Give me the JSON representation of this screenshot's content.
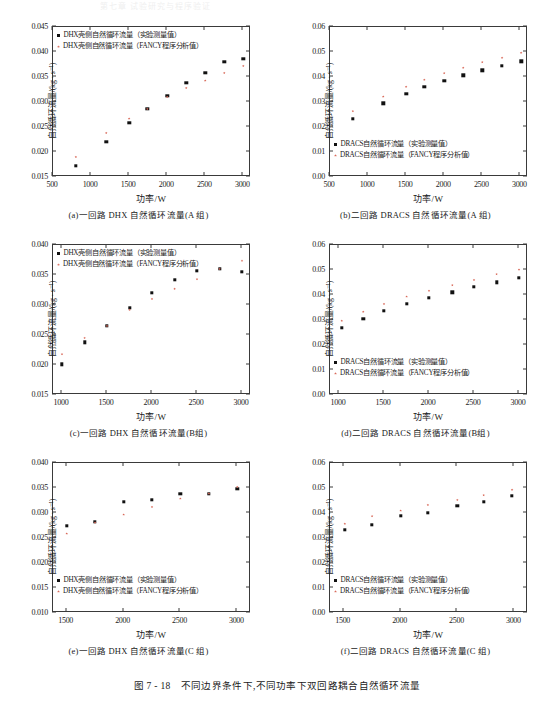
{
  "header": {
    "running_head": "第七章 试验研究与程序验证"
  },
  "figure": {
    "caption": "图 7 - 18　不同边界条件下,不同功率下双回路耦合自然循环流量",
    "xlabel": "功率/W",
    "ylabel_dhx": "自然循环流量/(kg · s⁻¹)",
    "ylabel_dracs": "自然循环流量/(kg · s⁻¹)"
  },
  "colors": {
    "experiment": "#111111",
    "fancy": "#d96a5a",
    "axis": "#3a3a3a"
  },
  "legends": {
    "dhx_exp": "DHX壳侧自然循环流量（实验测量值）",
    "dhx_fancy": "DHX壳侧自然循环流量（FANCY程序分析值）",
    "dracs_exp": "DRACS自然循环流量（实验测量值）",
    "dracs_fancy": "DRACS自然循环流量（FANCY程序分析值）"
  },
  "chart_data": [
    {
      "id": "a",
      "type": "scatter",
      "caption": "(a)一回路 DHX 自然循环流量(A 组)",
      "title": "",
      "xlabel": "功率/W",
      "ylabel": "自然循环流量/(kg · s⁻¹)",
      "xlim": [
        500,
        3100
      ],
      "ylim": [
        0.015,
        0.045
      ],
      "xticks": [
        500,
        1000,
        1500,
        2000,
        2500,
        3000
      ],
      "yticks": [
        0.015,
        0.02,
        0.025,
        0.03,
        0.035,
        0.04,
        0.045
      ],
      "ytick_labels": [
        "0.015",
        "0.020",
        "0.025",
        "0.030",
        "0.035",
        "0.040",
        "0.045"
      ],
      "legend_position": "upper-left",
      "grid": false,
      "x": [
        800,
        1200,
        1500,
        1740,
        2000,
        2250,
        2500,
        2750,
        3000
      ],
      "series": [
        {
          "name": "DHX壳侧自然循环流量（实验测量值）",
          "marker": "square",
          "color": "#111111",
          "values": [
            0.0173,
            0.0221,
            0.0258,
            0.0286,
            0.0312,
            0.0339,
            0.0358,
            0.038,
            0.0386
          ]
        },
        {
          "name": "DHX壳侧自然循环流量（FANCY程序分析值）",
          "marker": "star",
          "color": "#d96a5a",
          "values": [
            0.019,
            0.0238,
            0.0267,
            0.0286,
            0.031,
            0.0328,
            0.0343,
            0.0358,
            0.0372
          ]
        }
      ]
    },
    {
      "id": "b",
      "type": "scatter",
      "caption": "(b)二回路 DRACS 自然循环流量(A 组)",
      "title": "",
      "xlabel": "功率/W",
      "ylabel": "自然循环流量/(kg · s⁻¹)",
      "xlim": [
        500,
        3100
      ],
      "ylim": [
        0.0,
        0.06
      ],
      "xticks": [
        500,
        1000,
        1500,
        2000,
        2500,
        3000
      ],
      "yticks": [
        0.0,
        0.01,
        0.02,
        0.03,
        0.04,
        0.05,
        0.06
      ],
      "ytick_labels": [
        "0.00",
        "0.01",
        "0.02",
        "0.03",
        "0.04",
        "0.05",
        "0.06"
      ],
      "legend_position": "lower-left",
      "grid": false,
      "x": [
        800,
        1200,
        1500,
        1740,
        2000,
        2250,
        2500,
        2760,
        3010
      ],
      "series": [
        {
          "name": "DRACS自然循环流量（实验测量值）",
          "marker": "square",
          "color": "#111111",
          "values": [
            0.0232,
            0.0295,
            0.0332,
            0.0362,
            0.0384,
            0.0407,
            0.0427,
            0.0446,
            0.0463
          ]
        },
        {
          "name": "DRACS自然循环流量（FANCY程序分析值）",
          "marker": "star",
          "color": "#d96a5a",
          "values": [
            0.0263,
            0.0322,
            0.0361,
            0.0389,
            0.0415,
            0.0437,
            0.0459,
            0.0477,
            0.0497
          ]
        }
      ]
    },
    {
      "id": "c",
      "type": "scatter",
      "caption": "(c)一回路 DHX 自然循环流量(B组)",
      "title": "",
      "xlabel": "功率/W",
      "ylabel": "自然循环流量/(kg · s⁻¹)",
      "xlim": [
        900,
        3100
      ],
      "ylim": [
        0.015,
        0.04
      ],
      "xticks": [
        1000,
        1500,
        2000,
        2500,
        3000
      ],
      "yticks": [
        0.015,
        0.02,
        0.025,
        0.03,
        0.035,
        0.04
      ],
      "ytick_labels": [
        "0.015",
        "0.020",
        "0.025",
        "0.030",
        "0.035",
        "0.040"
      ],
      "legend_position": "upper-left",
      "grid": false,
      "x": [
        1000,
        1250,
        1500,
        1750,
        2000,
        2250,
        2500,
        2750,
        3000
      ],
      "series": [
        {
          "name": "DHX壳侧自然循环流量（实验测量值）",
          "marker": "square",
          "color": "#111111",
          "values": [
            0.0201,
            0.0238,
            0.0265,
            0.0295,
            0.032,
            0.0342,
            0.0357,
            0.036,
            0.0355
          ]
        },
        {
          "name": "DHX壳侧自然循环流量（FANCY程序分析值）",
          "marker": "star",
          "color": "#d96a5a",
          "values": [
            0.0218,
            0.0245,
            0.0265,
            0.0292,
            0.031,
            0.0327,
            0.0343,
            0.036,
            0.0374
          ]
        }
      ]
    },
    {
      "id": "d",
      "type": "scatter",
      "caption": "(d)二回路 DRACS 自然循环流量(B组)",
      "title": "",
      "xlabel": "功率/W",
      "ylabel": "自然循环流量/(kg · s⁻¹)",
      "xlim": [
        900,
        3100
      ],
      "ylim": [
        0.0,
        0.06
      ],
      "xticks": [
        1000,
        1500,
        2000,
        2500,
        3000
      ],
      "yticks": [
        0.0,
        0.01,
        0.02,
        0.03,
        0.04,
        0.05,
        0.06
      ],
      "ytick_labels": [
        "0.00",
        "0.01",
        "0.02",
        "0.03",
        "0.04",
        "0.05",
        "0.06"
      ],
      "legend_position": "lower-left",
      "grid": false,
      "x": [
        1030,
        1270,
        1500,
        1750,
        2000,
        2260,
        2500,
        2750,
        3000
      ],
      "series": [
        {
          "name": "DRACS自然循环流量（实验测量值）",
          "marker": "square",
          "color": "#111111",
          "values": [
            0.027,
            0.0305,
            0.0336,
            0.0366,
            0.0388,
            0.0411,
            0.0432,
            0.0451,
            0.047
          ]
        },
        {
          "name": "DRACS自然循环流量（FANCY程序分析值）",
          "marker": "star",
          "color": "#d96a5a",
          "values": [
            0.0297,
            0.0333,
            0.0364,
            0.0394,
            0.0417,
            0.0439,
            0.046,
            0.0483,
            0.0502
          ]
        }
      ]
    },
    {
      "id": "e",
      "type": "scatter",
      "caption": "(e)一回路 DHX 自然循环流量(C 组)",
      "title": "",
      "xlabel": "功率/W",
      "ylabel": "自然循环流量/(kg · s⁻¹)",
      "xlim": [
        1380,
        3120
      ],
      "ylim": [
        0.01,
        0.04
      ],
      "xticks": [
        1500,
        2000,
        2500,
        3000
      ],
      "yticks": [
        0.01,
        0.015,
        0.02,
        0.025,
        0.03,
        0.035,
        0.04
      ],
      "ytick_labels": [
        "0.010",
        "0.015",
        "0.020",
        "0.025",
        "0.030",
        "0.035",
        "0.040"
      ],
      "legend_position": "lower-left",
      "grid": false,
      "x": [
        1500,
        1750,
        2000,
        2250,
        2500,
        2750,
        3000
      ],
      "series": [
        {
          "name": "DHX壳侧自然循环流量（实验测量值）",
          "marker": "square",
          "color": "#111111",
          "values": [
            0.0274,
            0.0282,
            0.0323,
            0.0326,
            0.0339,
            0.0338,
            0.0348
          ]
        },
        {
          "name": "DHX壳侧自然循环流量（FANCY程序分析值）",
          "marker": "star",
          "color": "#d96a5a",
          "values": [
            0.0259,
            0.0281,
            0.0297,
            0.0312,
            0.0329,
            0.0339,
            0.0352
          ]
        }
      ]
    },
    {
      "id": "f",
      "type": "scatter",
      "caption": "(f)二回路 DRACS 自然循环流量(C 组)",
      "title": "",
      "xlabel": "功率/W",
      "ylabel": "自然循环流量/(kg · s⁻¹)",
      "xlim": [
        1380,
        3120
      ],
      "ylim": [
        0.0,
        0.06
      ],
      "xticks": [
        1500,
        2000,
        2500,
        3000
      ],
      "yticks": [
        0.0,
        0.01,
        0.02,
        0.03,
        0.04,
        0.05,
        0.06
      ],
      "ytick_labels": [
        "0.00",
        "0.01",
        "0.02",
        "0.03",
        "0.04",
        "0.05",
        "0.06"
      ],
      "legend_position": "lower-left",
      "grid": false,
      "x": [
        1510,
        1750,
        2000,
        2240,
        2500,
        2730,
        2980
      ],
      "series": [
        {
          "name": "DRACS自然循环流量（实验测量值）",
          "marker": "square",
          "color": "#111111",
          "values": [
            0.0334,
            0.0354,
            0.039,
            0.0402,
            0.0428,
            0.0445,
            0.047
          ]
        },
        {
          "name": "DRACS自然循环流量（FANCY程序分析值）",
          "marker": "star",
          "color": "#d96a5a",
          "values": [
            0.0357,
            0.0387,
            0.041,
            0.0432,
            0.0452,
            0.0471,
            0.0493
          ]
        }
      ]
    }
  ]
}
